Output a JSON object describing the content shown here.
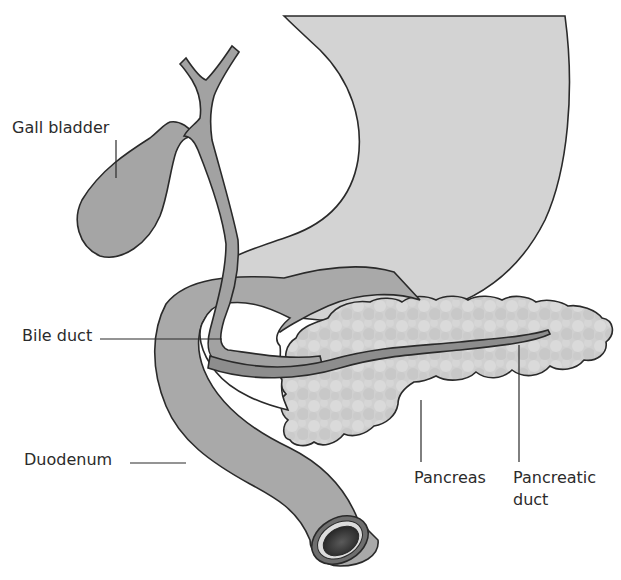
{
  "diagram": {
    "title": "",
    "colors": {
      "background": "#ffffff",
      "stomach": "#d2d2d2",
      "duodenum": "#a8a8a8",
      "gall_bladder": "#a4a4a4",
      "bile_duct": "#a0a0a0",
      "pancreas": "#cfcfcf",
      "pancreatic_duct": "#8c8c8c",
      "outline": "#2a2a2a",
      "label_text": "#2b2b2b"
    },
    "labels": {
      "gall_bladder": "Gall bladder",
      "bile_duct": "Bile duct",
      "duodenum": "Duodenum",
      "pancreas": "Pancreas",
      "pancreatic_duct_line1": "Pancreatic",
      "pancreatic_duct_line2": "duct"
    },
    "structures": [
      "stomach",
      "gall bladder",
      "bile duct",
      "duodenum",
      "pancreas",
      "pancreatic duct"
    ]
  }
}
